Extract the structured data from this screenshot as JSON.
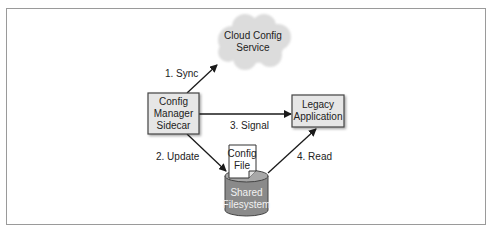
{
  "diagram": {
    "nodes": {
      "cloud": {
        "line1": "Cloud Config",
        "line2": "Service"
      },
      "sidecar": {
        "line1": "Config",
        "line2": "Manager",
        "line3": "Sidecar"
      },
      "legacy": {
        "line1": "Legacy",
        "line2": "Application"
      },
      "config_file": {
        "line1": "Config",
        "line2": "File"
      },
      "filesystem": {
        "line1": "Shared",
        "line2": "Filesystem"
      }
    },
    "edges": {
      "sync": "1. Sync",
      "update": "2. Update",
      "signal": "3. Signal",
      "read": "4. Read"
    },
    "colors": {
      "box_fill": "#e6e6e6",
      "box_stroke": "#444444",
      "cloud_fill": "#dcdcdc",
      "cylinder_fill": "#8a8a8a",
      "cylinder_top": "#a8a8a8",
      "arrow": "#1a1a1a",
      "frame": "#9a9a9a"
    }
  }
}
